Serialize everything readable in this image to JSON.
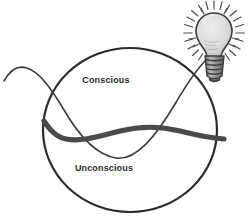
{
  "diagram": {
    "background_color": "#ffffff",
    "canvas": {
      "width": 252,
      "height": 223
    },
    "labels": {
      "conscious": "Conscious",
      "unconscious": "Unconscious"
    },
    "colors": {
      "outline": "#2b2b2b",
      "thick_wave": "#4a4a4a",
      "thin_curve": "#3a3a3a",
      "bulb_glass": "#dcdcdc",
      "bulb_outline": "#3b3b3b",
      "bulb_base": "#8f8f8f",
      "ray": "#4a4a4a",
      "label_text": "#2b2b2b"
    },
    "circle": {
      "name": "mind-boundary-circle",
      "center_x": 130,
      "center_y": 130,
      "radius_x": 87,
      "radius_y": 82,
      "stroke_width": 2.2
    },
    "thick_wave": {
      "name": "consciousness-threshold-wave",
      "stroke_width": 5.2,
      "description": "Thick gray wavy line dividing conscious from unconscious"
    },
    "thin_curve": {
      "name": "thought-path-curve",
      "stroke_width": 1.5,
      "description": "Thin curve entering from left, dipping into unconscious, rising to the lightbulb"
    },
    "lightbulb": {
      "name": "lightbulb-icon",
      "center_x": 214,
      "center_y": 34,
      "bulb_radius": 18,
      "ray_count": 24,
      "description": "Illuminated lightbulb representing an idea reaching consciousness"
    }
  }
}
